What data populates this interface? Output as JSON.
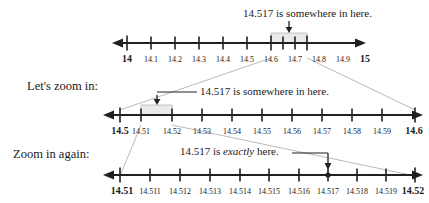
{
  "figure": {
    "title_text": "",
    "colors": {
      "line": "#231f20",
      "text": "#1a1a1a",
      "guide": "#8a8a8a",
      "highlight_fill": "#e8e8e8",
      "highlight_stroke": "#9a9a9a"
    }
  },
  "rows": [
    {
      "id": "row-1",
      "row_label": "",
      "annotation": "14.517 is somewhere in here.",
      "annotation_emphasis": "",
      "axis": {
        "start_value": 14,
        "end_value": 15,
        "step": 0.1
      },
      "tick_labels": [
        "14",
        "14.1",
        "14.2",
        "14.3",
        "14.4",
        "14.5",
        "14.6",
        "14.7",
        "14.8",
        "14.9",
        "15"
      ],
      "bold_ends": [
        "14",
        "15"
      ],
      "highlight_range": [
        "14.5",
        "14.6"
      ],
      "marker_value": null
    },
    {
      "id": "row-2",
      "row_label": "Let's zoom in:",
      "annotation": "14.517 is somewhere in here.",
      "annotation_emphasis": "",
      "axis": {
        "start_value": 14.5,
        "end_value": 14.6,
        "step": 0.01
      },
      "tick_labels": [
        "14.5",
        "14.51",
        "14.52",
        "14.53",
        "14.54",
        "14.55",
        "14.56",
        "14.57",
        "14.58",
        "14.59",
        "14.6"
      ],
      "bold_ends": [
        "14.5",
        "14.6"
      ],
      "highlight_range": [
        "14.51",
        "14.52"
      ],
      "marker_value": null
    },
    {
      "id": "row-3",
      "row_label": "Zoom in again:",
      "annotation_prefix": "14.517 is ",
      "annotation_emphasis": "exactly",
      "annotation_suffix": " here.",
      "axis": {
        "start_value": 14.51,
        "end_value": 14.52,
        "step": 0.001
      },
      "tick_labels": [
        "14.51",
        "14.511",
        "14.512",
        "14.513",
        "14.514",
        "14.515",
        "14.516",
        "14.517",
        "14.518",
        "14.519",
        "14.52"
      ],
      "bold_ends": [
        "14.51",
        "14.52"
      ],
      "highlight_range": null,
      "marker_value": "14.517"
    }
  ]
}
